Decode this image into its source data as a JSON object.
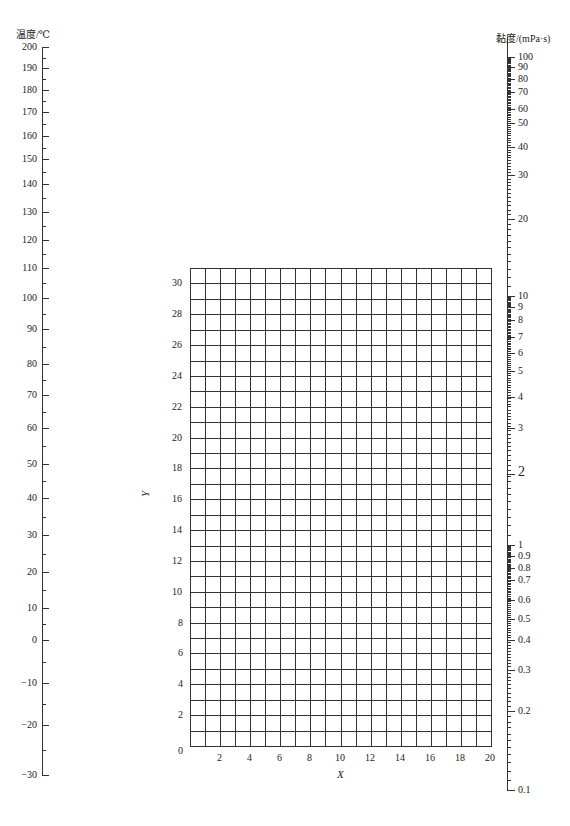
{
  "chart_data": {
    "type": "nomograph",
    "title": "",
    "left_axis": {
      "label": "温度/℃",
      "scale": "linear-ish",
      "range": [
        -30,
        200
      ],
      "ticks": [
        200,
        190,
        180,
        170,
        160,
        150,
        140,
        130,
        120,
        110,
        100,
        90,
        80,
        70,
        60,
        50,
        40,
        30,
        20,
        10,
        0,
        -10,
        -20,
        -30
      ],
      "tick_y": [
        47,
        68,
        90,
        112,
        136,
        159,
        184,
        212,
        240,
        268,
        298,
        329,
        364,
        395,
        428,
        464,
        498,
        535,
        572,
        608,
        640,
        683,
        725,
        775
      ]
    },
    "right_axis": {
      "label": "黏度/(mPa·s)",
      "scale": "log",
      "range": [
        0.1,
        100
      ],
      "ticks": [
        "100",
        "90",
        "80",
        "70",
        "60",
        "50",
        "40",
        "30",
        "20",
        "10",
        "9",
        "8",
        "7",
        "6",
        "5",
        "4",
        "3",
        "2",
        "1",
        "0.9",
        "0.8",
        "0.7",
        "0.6",
        "0.5",
        "0.4",
        "0.3",
        "0.2",
        "0.1"
      ],
      "tick_y": [
        37,
        45,
        54,
        63,
        76,
        89,
        113,
        142,
        187,
        296,
        307,
        320,
        337,
        353,
        371,
        397,
        428,
        474,
        545,
        556,
        568,
        580,
        600,
        619,
        640,
        670,
        711,
        790
      ]
    },
    "grid": {
      "xlabel": "X",
      "ylabel": "Y",
      "xlim": [
        0,
        20
      ],
      "ylim": [
        0,
        31
      ],
      "x_ticks": [
        2,
        4,
        6,
        8,
        10,
        12,
        14,
        16,
        18,
        20
      ],
      "y_ticks": [
        0,
        2,
        4,
        6,
        8,
        10,
        12,
        14,
        16,
        18,
        20,
        22,
        24,
        26,
        28,
        30
      ],
      "grid_on": true
    }
  }
}
